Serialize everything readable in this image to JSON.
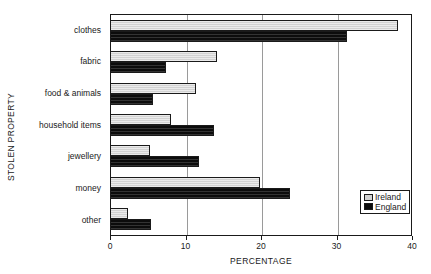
{
  "chart_data": {
    "type": "bar",
    "orientation": "horizontal",
    "title": "",
    "xlabel": "PERCENTAGE",
    "ylabel": "STOLEN PROPERTY",
    "categories": [
      "clothes",
      "fabric",
      "food & animals",
      "household items",
      "jewellery",
      "money",
      "other"
    ],
    "series": [
      {
        "name": "Ireland",
        "color": "#d2d2d2",
        "values": [
          38.0,
          14.0,
          11.3,
          8.0,
          5.1,
          19.8,
          2.3
        ]
      },
      {
        "name": "England",
        "color": "#0c0c0c",
        "values": [
          31.2,
          7.3,
          5.6,
          13.7,
          11.7,
          23.7,
          5.3
        ]
      }
    ],
    "xlim": [
      0,
      40
    ],
    "xticks": [
      0,
      10,
      20,
      30,
      40
    ],
    "xtick_labels": [
      "0",
      "10",
      "20",
      "30",
      "40"
    ],
    "grid": true,
    "grid_axis": "x",
    "legend_position": "bottom-right"
  },
  "legend": {
    "items": [
      {
        "label": "Ireland",
        "color": "#d2d2d2"
      },
      {
        "label": "England",
        "color": "#0c0c0c"
      }
    ]
  }
}
